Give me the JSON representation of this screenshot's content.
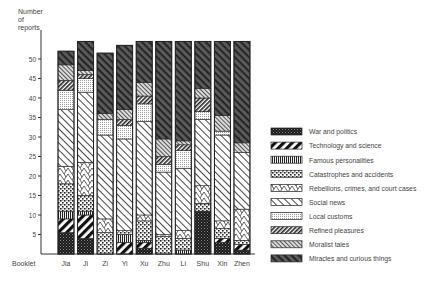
{
  "chart_data": {
    "type": "bar",
    "stacked": true,
    "title": "",
    "ylabel": "Number of reports",
    "xlabel": "Booklet",
    "ylim": [
      0,
      55
    ],
    "yticks": [
      5,
      10,
      15,
      20,
      25,
      30,
      35,
      40,
      45,
      50
    ],
    "grid": false,
    "legend_position": "right",
    "categories": [
      "Jia",
      "Ji",
      "Zi",
      "Yi",
      "Xu",
      "Zhu",
      "Li",
      "Shu",
      "Xin",
      "Zhen"
    ],
    "series": [
      {
        "name": "War and politics",
        "pattern": "war",
        "values": [
          5.5,
          4,
          0,
          0,
          1.5,
          0,
          0,
          11,
          3,
          1
        ]
      },
      {
        "name": "Technology and science",
        "pattern": "tech",
        "values": [
          3.5,
          6,
          0,
          3,
          1.5,
          0,
          0,
          0,
          1,
          1.5
        ]
      },
      {
        "name": "Famous personalities",
        "pattern": "famous",
        "values": [
          2,
          1,
          0,
          2,
          0.5,
          0,
          1,
          0,
          0,
          0
        ]
      },
      {
        "name": "Catastrophes and accidents",
        "pattern": "catas",
        "values": [
          7,
          4,
          5.5,
          1,
          5,
          4.5,
          3,
          2,
          2.5,
          1
        ]
      },
      {
        "name": "Rebellions, crimes, and court cases",
        "pattern": "rebel",
        "values": [
          4.5,
          8.5,
          3.5,
          0,
          1.5,
          0.5,
          2,
          4.5,
          2,
          8
        ]
      },
      {
        "name": "Social news",
        "pattern": "social",
        "values": [
          14.5,
          18,
          21.5,
          23.5,
          24,
          16,
          16,
          17,
          22,
          14.5
        ]
      },
      {
        "name": "Local customs",
        "pattern": "local",
        "values": [
          5,
          3.5,
          4,
          3.5,
          4.5,
          2,
          4.5,
          2,
          1,
          0
        ]
      },
      {
        "name": "Refined pleasures",
        "pattern": "refined",
        "values": [
          2.5,
          1,
          0,
          1.5,
          2,
          2,
          1.5,
          3.5,
          0,
          0
        ]
      },
      {
        "name": "Moralist tales",
        "pattern": "moral",
        "values": [
          4,
          1,
          1.5,
          2.5,
          3.5,
          4.5,
          1,
          2.5,
          4,
          2.5
        ]
      },
      {
        "name": "Miracles and curious things",
        "pattern": "miracle",
        "values": [
          3.5,
          7.5,
          15.5,
          16.5,
          10.5,
          25,
          25.5,
          12,
          19,
          26
        ]
      }
    ]
  },
  "axis": {
    "ylabel_lines": [
      "Number",
      "of",
      "reports"
    ],
    "xlabel": "Booklet"
  }
}
